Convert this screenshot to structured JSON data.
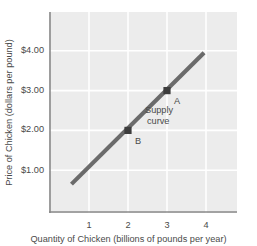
{
  "chart_data": {
    "type": "line",
    "title": "",
    "xlabel": "Quantity of Chicken (billions of pounds per year)",
    "ylabel": "Price of Chicken (dollars per pound)",
    "xlim": [
      0.2,
      4.5
    ],
    "ylim": [
      0.2,
      4.55
    ],
    "xticks": [
      1,
      2,
      3,
      4
    ],
    "xtick_labels": [
      "1",
      "2",
      "3",
      "4"
    ],
    "yticks": [
      1.0,
      2.0,
      3.0,
      4.0
    ],
    "ytick_labels": [
      "$1.00",
      "$2.00",
      "$3.00",
      "$4.00"
    ],
    "grid": true,
    "legend": "none",
    "series": [
      {
        "name": "Supply curve",
        "type": "line",
        "color": "#6b6b6b",
        "x": [
          0.55,
          3.95
        ],
        "values": [
          0.65,
          3.95
        ]
      }
    ],
    "points": [
      {
        "label": "A",
        "x": 3,
        "y": 3.0,
        "marker": "square",
        "color": "#3d3d3d"
      },
      {
        "label": "B",
        "x": 2,
        "y": 2.0,
        "marker": "square",
        "color": "#3d3d3d"
      }
    ],
    "annotations": [
      {
        "name": "supply-curve-label",
        "text_line1": "Supply",
        "text_line2": "curve",
        "x": 2.45,
        "y": 2.52
      },
      {
        "name": "point-a-label",
        "text": "A",
        "x": 3.25,
        "y": 2.72
      },
      {
        "name": "point-b-label",
        "text": "B",
        "x": 2.25,
        "y": 1.72
      }
    ]
  },
  "style": {
    "plot_background": "#ececec",
    "gridline_color": "#ffffff",
    "frame_color": "#8a8a8a",
    "line_color": "#6b6b6b",
    "marker_color": "#3d3d3d",
    "text_color": "#4a4a4a"
  }
}
